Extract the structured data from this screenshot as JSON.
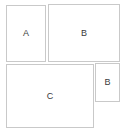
{
  "canvas": {
    "width": 126,
    "height": 134,
    "background_color": "#ffffff",
    "border_color": "#c9c9c9",
    "label_color": "#3a3a3a"
  },
  "diagram": {
    "type": "box-layout",
    "boxes": [
      {
        "id": "box-a",
        "label": "A",
        "x": 6,
        "y": 5,
        "width": 40,
        "height": 57,
        "position": "top-left"
      },
      {
        "id": "box-b-large",
        "label": "B",
        "x": 48,
        "y": 4,
        "width": 72,
        "height": 58,
        "position": "top-right"
      },
      {
        "id": "box-c",
        "label": "C",
        "x": 6,
        "y": 64,
        "width": 88,
        "height": 64,
        "position": "bottom-left"
      },
      {
        "id": "box-b-small",
        "label": "B",
        "x": 95,
        "y": 63,
        "width": 25,
        "height": 39,
        "position": "bottom-right"
      }
    ]
  }
}
